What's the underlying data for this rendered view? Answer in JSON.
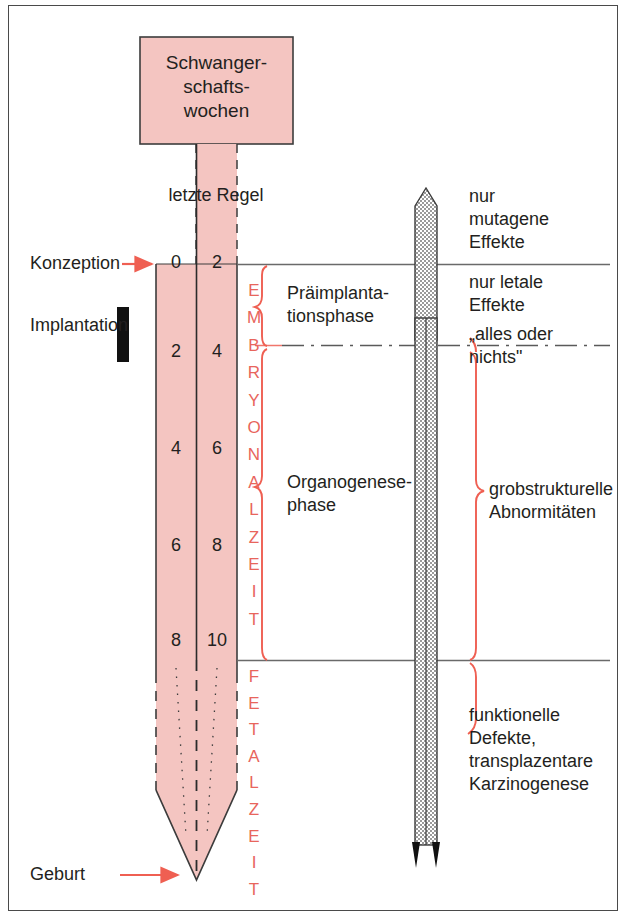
{
  "diagram": {
    "title_box": {
      "lines": [
        "Schwanger-",
        "schafts-",
        "wochen"
      ]
    },
    "timeline_label": "letzte Regel",
    "left_labels": [
      {
        "name": "konzeption",
        "text": "Konzeption"
      },
      {
        "name": "implantation",
        "text": "Implantation"
      },
      {
        "name": "geburt",
        "text": "Geburt"
      }
    ],
    "week_rows": [
      {
        "left": "0",
        "right": "2"
      },
      {
        "left": "2",
        "right": "4"
      },
      {
        "left": "4",
        "right": "6"
      },
      {
        "left": "6",
        "right": "8"
      },
      {
        "left": "8",
        "right": "10"
      }
    ],
    "vertical_labels": [
      {
        "name": "embryonalzeit",
        "text": "EMBRYONALZEIT"
      },
      {
        "name": "fetalzeit",
        "text": "FETALZEIT"
      }
    ],
    "phase_labels": [
      {
        "name": "praeimplantationsphase",
        "lines": [
          "Präimplanta-",
          "tionsphase"
        ]
      },
      {
        "name": "organogenesephase",
        "lines": [
          "Organogenese-",
          "phase"
        ]
      }
    ],
    "effect_labels": [
      {
        "name": "nur-mutagene-effekte",
        "lines": [
          "nur",
          "mutagene",
          "Effekte"
        ]
      },
      {
        "name": "nur-letale-effekte",
        "lines": [
          "nur letale",
          "Effekte"
        ]
      },
      {
        "name": "alles-oder-nichts",
        "lines": [
          "„alles oder",
          "nichts\""
        ]
      },
      {
        "name": "grobstrukturelle-abnormitaeten",
        "lines": [
          "grobstrukturelle",
          "Abnormitäten"
        ]
      },
      {
        "name": "funktionelle-defekte",
        "lines": [
          "funktionelle",
          "Defekte,",
          "transplazentare",
          "Karzinogenese"
        ]
      }
    ],
    "colors": {
      "pink_fill": "#f4c5c1",
      "pink_accent": "#e8655c",
      "outline": "#3c3c3c",
      "text": "#231f20",
      "gray_bar": "#b8b8b8",
      "black_marker": "#111111"
    }
  }
}
